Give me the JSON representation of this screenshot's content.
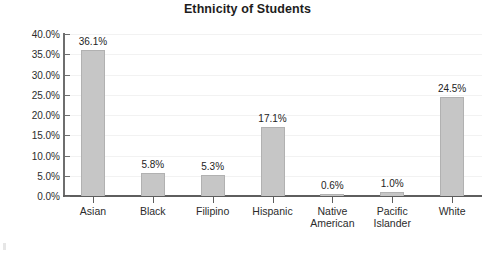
{
  "chart_data": {
    "type": "bar",
    "title": "Ethnicity of Students",
    "xlabel": "",
    "ylabel": "",
    "categories": [
      "Asian",
      "Black",
      "Filipino",
      "Hispanic",
      "Native American",
      "Pacific Islander",
      "White"
    ],
    "category_lines": [
      [
        "Asian"
      ],
      [
        "Black"
      ],
      [
        "Filipino"
      ],
      [
        "Hispanic"
      ],
      [
        "Native",
        "American"
      ],
      [
        "Pacific",
        "Islander"
      ],
      [
        "White"
      ]
    ],
    "values": [
      36.1,
      5.8,
      5.3,
      17.1,
      0.6,
      1.0,
      24.5
    ],
    "data_labels": [
      "36.1%",
      "5.8%",
      "5.3%",
      "17.1%",
      "0.6%",
      "1.0%",
      "24.5%"
    ],
    "ylim": [
      0,
      40
    ],
    "ytick_values": [
      0,
      5,
      10,
      15,
      20,
      25,
      30,
      35,
      40
    ],
    "ytick_labels": [
      "0.0%",
      "5.0%",
      "10.0%",
      "15.0%",
      "20.0%",
      "25.0%",
      "30.0%",
      "35.0%",
      "40.0%"
    ],
    "grid": true,
    "legend": null,
    "colors": {
      "bar_fill": "#c6c6c6",
      "bar_border": "#b1b1b1",
      "axis": "#5e5e5e",
      "gridline": "#f2f2f2",
      "text": "#2b2b2b",
      "title": "#1d1d1d",
      "background": "#ffffff"
    }
  }
}
